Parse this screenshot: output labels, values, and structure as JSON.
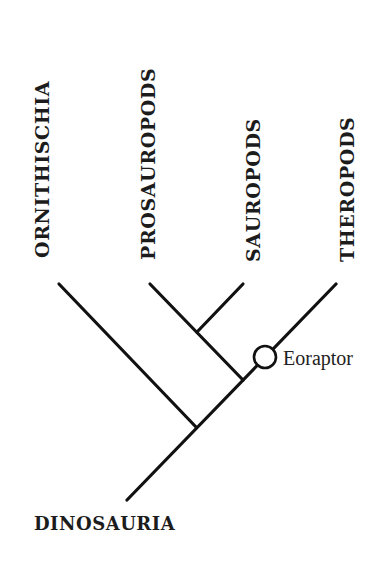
{
  "diagram": {
    "type": "cladogram",
    "root": {
      "label": "DINOSAURIA"
    },
    "taxa": [
      {
        "label": "ORNITHISCHIA"
      },
      {
        "label": "PROSAUROPODS"
      },
      {
        "label": "SAUROPODS"
      },
      {
        "label": "THEROPODS"
      }
    ],
    "marker": {
      "label": "Eoraptor",
      "shape": "open-circle",
      "on_branch": "THEROPODS"
    },
    "colors": {
      "line": "#111111",
      "text": "#1c1c1c",
      "background": "#ffffff"
    }
  }
}
